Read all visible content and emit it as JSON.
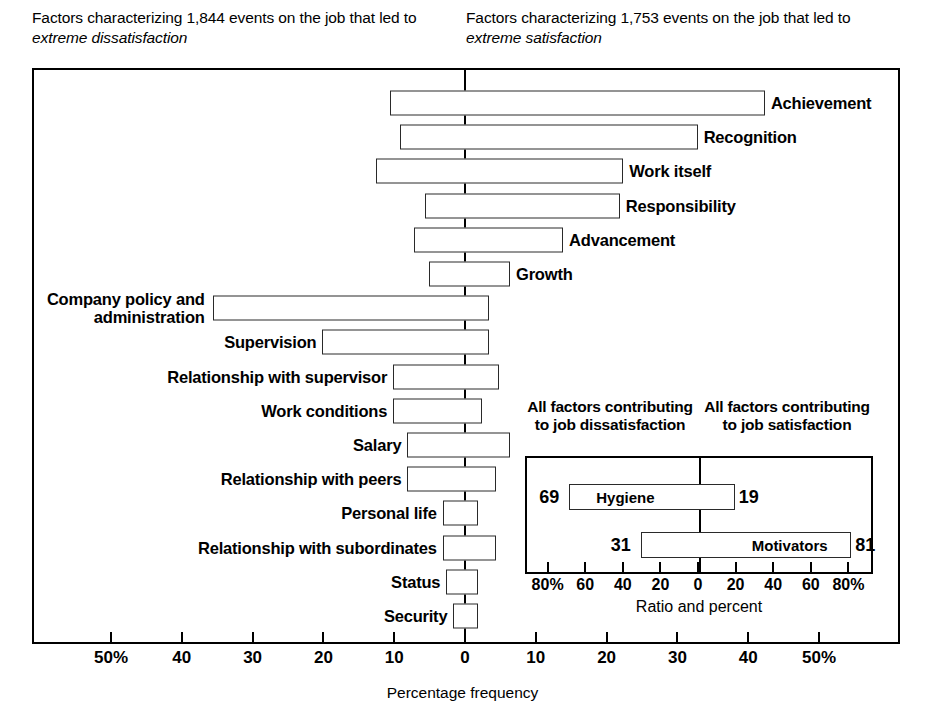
{
  "headers": {
    "left_prefix": "Factors characterizing 1,844 events on the job that led to ",
    "left_emphasis": "extreme dissatisfaction",
    "right_prefix": "Factors characterizing 1,753 events on the job that led to ",
    "right_emphasis": "extreme satisfaction"
  },
  "axis": {
    "title": "Percentage frequency",
    "ticks": [
      {
        "label": "50%",
        "value": -50
      },
      {
        "label": "40",
        "value": -40
      },
      {
        "label": "30",
        "value": -30
      },
      {
        "label": "20",
        "value": -20
      },
      {
        "label": "10",
        "value": -10
      },
      {
        "label": "0",
        "value": 0
      },
      {
        "label": "10",
        "value": 10
      },
      {
        "label": "20",
        "value": 20
      },
      {
        "label": "30",
        "value": 30
      },
      {
        "label": "40",
        "value": 40
      },
      {
        "label": "50%",
        "value": 50
      }
    ]
  },
  "inset": {
    "head_left": "All factors contributing to job dissatisfaction",
    "head_right": "All factors contributing to job satisfaction",
    "axis_title": "Ratio and percent",
    "ticks": [
      {
        "label": "80%",
        "value": -80
      },
      {
        "label": "60",
        "value": -60
      },
      {
        "label": "40",
        "value": -40
      },
      {
        "label": "20",
        "value": -20
      },
      {
        "label": "0",
        "value": 0
      },
      {
        "label": "20",
        "value": 20
      },
      {
        "label": "40",
        "value": 40
      },
      {
        "label": "60",
        "value": 60
      },
      {
        "label": "80%",
        "value": 80
      }
    ],
    "rows": [
      {
        "name": "Hygiene",
        "left": 69,
        "right": 19,
        "label_side": "left"
      },
      {
        "name": "Motivators",
        "left": 31,
        "right": 81,
        "label_side": "right"
      }
    ]
  },
  "chart_data": {
    "type": "bar",
    "xlabel": "Percentage frequency",
    "ylabel": "",
    "xlim": [
      -57,
      57
    ],
    "grid": false,
    "orientation": "horizontal-diverging",
    "note": "Left of zero = percentage frequency of factor in extreme dissatisfaction events; right of zero = extreme satisfaction events.",
    "categories": [
      "Achievement",
      "Recognition",
      "Work itself",
      "Responsibility",
      "Advancement",
      "Growth",
      "Company policy and administration",
      "Supervision",
      "Relationship with supervisor",
      "Work conditions",
      "Salary",
      "Relationship with peers",
      "Personal life",
      "Relationship with subordinates",
      "Status",
      "Security"
    ],
    "series": [
      {
        "name": "extreme dissatisfaction",
        "side": "left",
        "values": [
          10.5,
          9.0,
          12.5,
          5.5,
          7.0,
          5.0,
          35.5,
          20.0,
          10.0,
          10.0,
          8.0,
          8.0,
          3.0,
          3.0,
          2.5,
          1.5
        ]
      },
      {
        "name": "extreme satisfaction",
        "side": "right",
        "values": [
          42.5,
          33.0,
          22.5,
          22.0,
          14.0,
          6.5,
          3.5,
          3.5,
          5.0,
          2.5,
          6.5,
          4.5,
          2.0,
          4.5,
          2.0,
          2.0
        ]
      }
    ],
    "label_placement": [
      "right",
      "right",
      "right",
      "right",
      "right",
      "right",
      "left",
      "left",
      "left",
      "left",
      "left",
      "left",
      "left",
      "left",
      "left",
      "left"
    ]
  }
}
